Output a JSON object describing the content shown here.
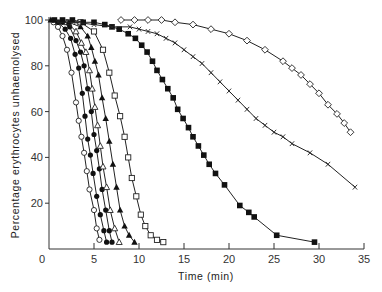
{
  "chart_data": {
    "type": "line",
    "title": "",
    "xlabel": "Time  (min)",
    "ylabel": "Percentage erythrocytes unhaemolysed",
    "xlim": [
      0,
      35
    ],
    "ylim": [
      0,
      100
    ],
    "xticks": [
      0,
      5,
      10,
      15,
      20,
      25,
      30,
      35
    ],
    "yticks": [
      20,
      40,
      60,
      80,
      100
    ],
    "ytick_labels": [
      "20",
      "40",
      "60",
      "80",
      "100"
    ],
    "xtick_labels": [
      "0",
      "5",
      "10",
      "15",
      "20",
      "25",
      "30",
      "35"
    ],
    "grid": false,
    "legend": "none",
    "series": [
      {
        "name": "open circles",
        "marker": "circle-open",
        "x": [
          0.5,
          1.0,
          1.5,
          2.0,
          2.5,
          3.0,
          3.3,
          3.6,
          3.9,
          4.2,
          4.5,
          5.0,
          5.3,
          5.6
        ],
        "y": [
          99,
          97,
          93,
          87,
          77,
          64,
          56,
          49,
          42,
          34,
          26,
          17,
          9,
          4
        ]
      },
      {
        "name": "filled circles A",
        "marker": "circle-filled",
        "x": [
          1.0,
          1.8,
          2.4,
          2.9,
          3.3,
          3.7,
          4.0,
          4.3,
          4.6,
          4.9,
          5.3,
          5.7,
          6.1,
          6.4
        ],
        "y": [
          99,
          96,
          92,
          85,
          79,
          68,
          58,
          48,
          41,
          33,
          23,
          15,
          8,
          3
        ]
      },
      {
        "name": "filled circles B",
        "marker": "circle-filled",
        "x": [
          1.5,
          2.3,
          3.0,
          3.5,
          3.9,
          4.3,
          4.7,
          5.0,
          5.3,
          5.6,
          5.9,
          6.3,
          6.7,
          7.0
        ],
        "y": [
          99,
          97,
          91,
          86,
          80,
          70,
          60,
          50,
          43,
          35,
          26,
          17,
          8,
          3
        ]
      },
      {
        "name": "open triangles",
        "marker": "triangle-open",
        "x": [
          2.0,
          3.0,
          3.6,
          4.1,
          4.5,
          4.8,
          5.1,
          5.4,
          5.7,
          6.0,
          6.4,
          6.8,
          7.3,
          7.8
        ],
        "y": [
          99,
          95,
          90,
          86,
          78,
          70,
          62,
          54,
          45,
          36,
          27,
          17,
          9,
          3
        ]
      },
      {
        "name": "filled triangles",
        "marker": "triangle-filled",
        "x": [
          0.2,
          2.2,
          3.5,
          4.3,
          4.7,
          5.1,
          5.5,
          5.9,
          6.3,
          6.7,
          7.1,
          7.5,
          7.9,
          8.4,
          8.9,
          9.5
        ],
        "y": [
          100,
          99,
          97,
          93,
          88,
          82,
          76,
          66,
          57,
          47,
          37,
          27,
          17,
          10,
          6,
          3
        ]
      },
      {
        "name": "open squares",
        "marker": "square-open",
        "x": [
          3.5,
          5.0,
          6.0,
          6.7,
          7.3,
          7.9,
          8.4,
          8.8,
          9.2,
          9.7,
          10.2,
          10.7,
          11.3,
          12.0,
          12.7
        ],
        "y": [
          99,
          95,
          87,
          77,
          67,
          58,
          49,
          40,
          31,
          23,
          15,
          10,
          6,
          4,
          3
        ]
      },
      {
        "name": "filled squares",
        "marker": "square-filled",
        "x": [
          0.6,
          1.5,
          2.6,
          3.8,
          5.0,
          6.2,
          7.0,
          7.8,
          8.8,
          9.6,
          10.3,
          10.9,
          11.5,
          12.0,
          12.6,
          13.2,
          13.8,
          14.3,
          14.9,
          15.5,
          16.0,
          16.6,
          17.2,
          17.8,
          18.5,
          19.5,
          21.2,
          22.2,
          22.8,
          25.3,
          29.5
        ],
        "y": [
          100,
          100,
          100,
          99,
          99,
          98,
          97,
          96,
          94,
          92,
          89,
          86,
          82,
          78,
          74,
          70,
          66,
          61,
          57,
          53,
          49,
          45,
          41,
          37,
          33,
          28,
          19,
          16,
          14,
          6,
          3
        ]
      },
      {
        "name": "crosses",
        "marker": "x",
        "x": [
          1.0,
          3.0,
          5.0,
          7.0,
          9.0,
          10.0,
          11.0,
          12.0,
          13.0,
          14.0,
          15.0,
          16.0,
          17.0,
          18.0,
          19.0,
          20.0,
          21.0,
          22.0,
          23.0,
          24.0,
          25.0,
          26.0,
          27.0,
          29.0,
          31.0,
          34.0
        ],
        "y": [
          99,
          99,
          98,
          97,
          97,
          96,
          95,
          94,
          92,
          90,
          87,
          84,
          81,
          77,
          73,
          69,
          65,
          61,
          57,
          54,
          51,
          49,
          46,
          42,
          37,
          27
        ]
      },
      {
        "name": "open diamonds",
        "marker": "diamond-open",
        "x": [
          8.0,
          9.5,
          11.0,
          12.5,
          14.0,
          16.0,
          18.0,
          20.0,
          22.0,
          24.0,
          26.0,
          27.0,
          28.0,
          29.0,
          30.0,
          31.0,
          32.0,
          32.8,
          33.5
        ],
        "y": [
          100,
          100,
          100,
          100,
          99,
          98,
          96,
          94,
          91,
          87,
          82,
          79,
          76,
          72,
          68,
          63,
          59,
          55,
          51
        ]
      }
    ]
  }
}
